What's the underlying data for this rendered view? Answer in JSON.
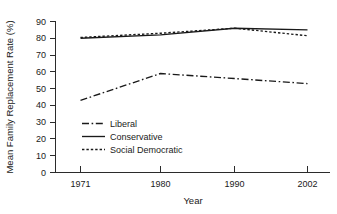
{
  "chart_data": {
    "type": "line",
    "title": "",
    "xlabel": "Year",
    "ylabel": "Mean Family Replacement Rate (%)",
    "categories": [
      "1971",
      "1980",
      "1990",
      "2002"
    ],
    "x": [
      1971,
      1980,
      1990,
      2002
    ],
    "xlim": [
      1967,
      2006
    ],
    "ylim": [
      0,
      90
    ],
    "yticks": [
      "0",
      "10",
      "20",
      "30",
      "40",
      "50",
      "60",
      "70",
      "80",
      "90"
    ],
    "ytick_values": [
      0,
      10,
      20,
      30,
      40,
      50,
      60,
      70,
      80,
      90
    ],
    "xticks": [
      "1971",
      "1980",
      "1990",
      "2002"
    ],
    "grid": false,
    "legend_position": "inside-lower-left",
    "series": [
      {
        "name": "Liberal",
        "style": "dash-dot",
        "values": [
          43,
          59,
          56,
          53
        ]
      },
      {
        "name": "Conservative",
        "style": "solid",
        "values": [
          80,
          82,
          86,
          85
        ]
      },
      {
        "name": "Social Democratic",
        "style": "dotted",
        "values": [
          80.5,
          83,
          86,
          81.5
        ]
      }
    ]
  },
  "legend": {
    "items": [
      {
        "label": "Liberal"
      },
      {
        "label": "Conservative"
      },
      {
        "label": "Social Democratic"
      }
    ]
  },
  "axes": {
    "y_title": "Mean Family Replacement Rate (%)",
    "x_title": "Year"
  },
  "colors": {
    "ink": "#1a1a1a",
    "axis": "#2b2b2b",
    "background": "#ffffff"
  }
}
